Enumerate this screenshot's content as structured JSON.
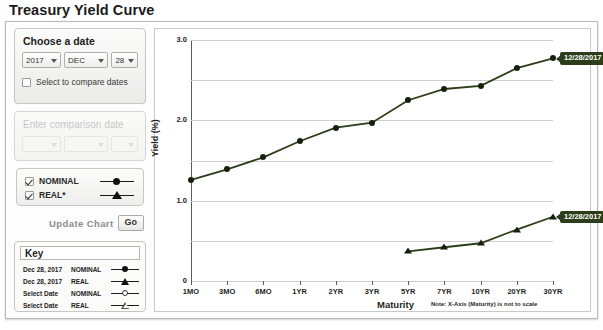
{
  "page": {
    "title": "Treasury Yield Curve"
  },
  "controls": {
    "choose_date": {
      "title": "Choose a date",
      "year": "2017",
      "month": "DEC",
      "day": "28",
      "compare_checkbox_label": "Select to compare dates",
      "compare_checked": false
    },
    "comparison_date": {
      "title": "Enter comparison date",
      "year": "",
      "month": "",
      "day": "",
      "enabled": false
    },
    "series_toggles": [
      {
        "label": "NOMINAL",
        "checked": true,
        "marker": "filled-circle"
      },
      {
        "label": "REAL*",
        "checked": true,
        "marker": "filled-triangle"
      }
    ],
    "update": {
      "label": "Update Chart",
      "button_label": "Go"
    },
    "key": {
      "title": "Key",
      "rows": [
        {
          "date": "Dec 28, 2017",
          "type": "NOMINAL",
          "marker": "filled-circle"
        },
        {
          "date": "Dec 28, 2017",
          "type": "REAL",
          "marker": "filled-triangle"
        },
        {
          "date": "Select Date",
          "type": "NOMINAL",
          "marker": "open-circle"
        },
        {
          "date": "Select Date",
          "type": "REAL",
          "marker": "open-triangle"
        }
      ]
    }
  },
  "chart_data": {
    "type": "line",
    "title": "",
    "xlabel": "Maturity",
    "ylabel": "Yield (%)",
    "note": "Note: X-Axis (Maturity) is not to scale",
    "categories": [
      "1MO",
      "3MO",
      "6MO",
      "1YR",
      "2YR",
      "3YR",
      "5YR",
      "7YR",
      "10YR",
      "20YR",
      "30YR"
    ],
    "ylim": [
      0,
      3.0
    ],
    "ytick_labels": [
      "0",
      "1.0",
      "2.0",
      "3.0"
    ],
    "ytick_values": [
      0,
      1.0,
      2.0,
      3.0
    ],
    "gridlines": [
      0,
      0.5,
      1.0,
      1.5,
      2.0,
      2.5,
      3.0
    ],
    "grid": true,
    "legend_position": "external-key-panel",
    "series": [
      {
        "name": "NOMINAL",
        "label": "Dec 28, 2017 NOMINAL",
        "marker": "filled-circle",
        "color": "#2c3d19",
        "values": [
          1.26,
          1.39,
          1.54,
          1.74,
          1.91,
          1.97,
          2.25,
          2.39,
          2.43,
          2.65,
          2.77
        ],
        "callout": "12/28/2017"
      },
      {
        "name": "REAL",
        "label": "Dec 28, 2017 REAL",
        "marker": "filled-triangle",
        "color": "#2c3d19",
        "values": [
          null,
          null,
          null,
          null,
          null,
          null,
          0.37,
          0.42,
          0.47,
          0.64,
          0.8
        ],
        "callout": "12/28/2017"
      }
    ]
  }
}
